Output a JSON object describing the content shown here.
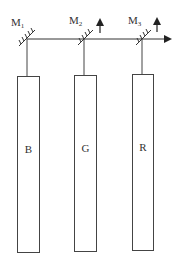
{
  "diagram": {
    "mirrors": [
      {
        "label": "M",
        "sub": "1",
        "x": 27,
        "has_arrow": false
      },
      {
        "label": "M",
        "sub": "2",
        "x": 84,
        "has_arrow": true
      },
      {
        "label": "M",
        "sub": "3",
        "x": 142,
        "has_arrow": true
      }
    ],
    "channels": [
      {
        "label": "B"
      },
      {
        "label": "G"
      },
      {
        "label": "R"
      }
    ],
    "colors": {
      "stroke": "#333333",
      "background": "#ffffff"
    }
  }
}
